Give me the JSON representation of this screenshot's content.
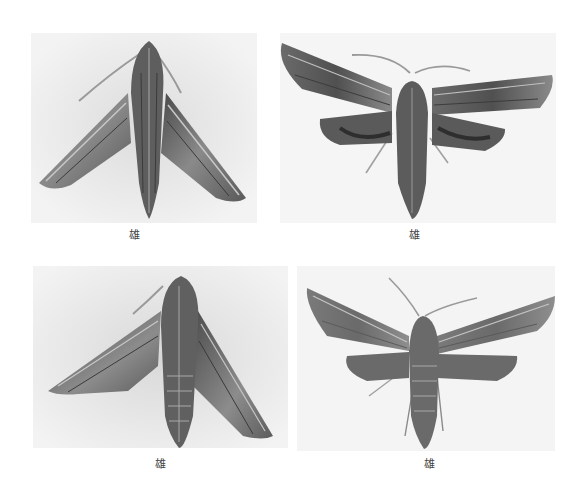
{
  "plates": [
    {
      "id": "tl",
      "caption": "雄",
      "view": "dorsal, wings folded (resting)"
    },
    {
      "id": "tr",
      "caption": "雄",
      "view": "dorsal, wings spread"
    },
    {
      "id": "bl",
      "caption": "雄",
      "view": "dorsal, wings folded (resting)"
    },
    {
      "id": "br",
      "caption": "雄",
      "view": "dorsal, wings spread"
    }
  ],
  "colors": {
    "background": "#ffffff",
    "photo_bg": "#f1f1f1",
    "moth_dark": "#3f3f3f",
    "moth_mid": "#7a7a7a",
    "moth_light": "#b5b5b5"
  }
}
